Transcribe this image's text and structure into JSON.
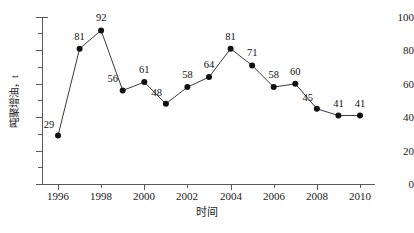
{
  "chart_data": {
    "type": "line",
    "title": "",
    "xlabel": "时间",
    "ylabel": "吨聚增油，t",
    "categories": [
      1996,
      1997,
      1998,
      1999,
      2000,
      2001,
      2002,
      2003,
      2004,
      2005,
      2006,
      2007,
      2008,
      2009,
      2010
    ],
    "values": [
      29,
      81,
      92,
      56,
      61,
      48,
      58,
      64,
      81,
      71,
      58,
      60,
      45,
      41,
      41
    ],
    "series": [
      {
        "name": "吨聚增油",
        "values": [
          29,
          81,
          92,
          56,
          61,
          48,
          58,
          64,
          81,
          71,
          58,
          60,
          45,
          41,
          41
        ]
      }
    ],
    "point_labels": [
      "29",
      "81",
      "92",
      "56",
      "61",
      "48",
      "58",
      "64",
      "81",
      "71",
      "58",
      "60",
      "45",
      "41",
      "41"
    ],
    "xlim": [
      1995.5,
      2010.8
    ],
    "ylim": [
      0,
      100
    ],
    "ytick_labels": [
      "100",
      "80",
      "60",
      "40",
      "20",
      "0"
    ],
    "ytick_values": [
      100,
      80,
      60,
      40,
      20,
      0
    ],
    "ytick_minor_values": [
      90,
      70,
      50,
      30,
      10
    ],
    "xtick_labels": [
      "1996",
      "1998",
      "2000",
      "2002",
      "2004",
      "2006",
      "2008",
      "2010"
    ],
    "xtick_values": [
      1996,
      1998,
      2000,
      2002,
      2004,
      2006,
      2008,
      2010
    ],
    "xtick_minor_values": [
      1997,
      1999,
      2001,
      2003,
      2005,
      2007,
      2009
    ],
    "grid": false,
    "legend": false,
    "marker": "filled-circle",
    "line_color": "#3a3a3a",
    "marker_color": "#111111",
    "axis_color": "#5a5a5a",
    "background": "#ffffff"
  }
}
